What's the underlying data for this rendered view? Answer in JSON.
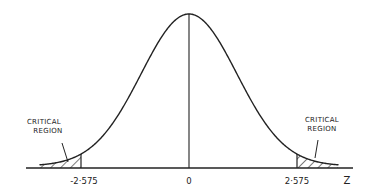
{
  "diagram": {
    "title": "",
    "curve": "standard normal distribution",
    "axis_variable": "Z",
    "tick_labels": {
      "left_critical": "-2·575",
      "center": "0",
      "right_critical": "2·575"
    },
    "critical_values": [
      -2.575,
      2.575
    ],
    "annotations": {
      "left": [
        "CRITICAL",
        "REGION"
      ],
      "right": [
        "CRITICAL",
        "REGION"
      ]
    },
    "colors": {
      "ink": "#222222",
      "background": "#ffffff"
    }
  }
}
